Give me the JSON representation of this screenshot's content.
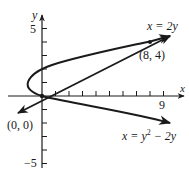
{
  "figure": {
    "type": "function-graph",
    "axes": {
      "x_label": "x",
      "y_label": "y",
      "x_ticks": [
        1,
        2,
        3,
        4,
        5,
        6,
        7,
        8,
        9
      ],
      "x_tick_labels": [
        {
          "value": 9,
          "text": "9"
        }
      ],
      "y_ticks": [
        -5,
        -4,
        -3,
        -2,
        -1,
        1,
        2,
        3,
        4,
        5
      ],
      "y_tick_labels": [
        {
          "value": 5,
          "text": "5"
        },
        {
          "value": -5,
          "text": "−5"
        }
      ],
      "origin_px": [
        42,
        96
      ],
      "scale_px_per_unit": 13.5
    },
    "curves": [
      {
        "name": "parabola",
        "equation": "x = y² − 2y",
        "label": "x = y2 − 2y",
        "label_parts": {
          "lhs": "x = y",
          "exp": "2",
          "rhs": " − 2y"
        }
      },
      {
        "name": "line",
        "equation": "x = 2y",
        "label": "x = 2y"
      }
    ],
    "points": [
      {
        "label": "(0, 0)",
        "x": 0,
        "y": 0
      },
      {
        "label": "(8, 4)",
        "x": 8,
        "y": 4
      }
    ],
    "colors": {
      "ink": "#1a1a1a",
      "background": "#ffffff"
    }
  }
}
